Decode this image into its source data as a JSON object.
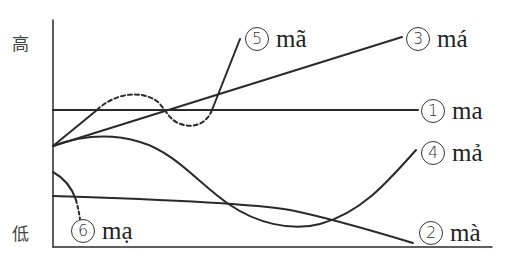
{
  "diagram": {
    "type": "vietnamese-tone-contour-diagram",
    "y_axis": {
      "high_label": "高",
      "low_label": "低"
    },
    "tones": [
      {
        "number": "1",
        "syllable": "ma",
        "contour": "level-high"
      },
      {
        "number": "2",
        "syllable": "mà",
        "contour": "low-falling"
      },
      {
        "number": "3",
        "syllable": "má",
        "contour": "rising"
      },
      {
        "number": "4",
        "syllable": "mả",
        "contour": "dipping-rising"
      },
      {
        "number": "5",
        "syllable": "mã",
        "contour": "broken-rising (glottalized)"
      },
      {
        "number": "6",
        "syllable": "mạ",
        "contour": "short-falling (glottal stop)"
      }
    ],
    "stroke_color": "#2a2a2a",
    "background": "#ffffff"
  }
}
